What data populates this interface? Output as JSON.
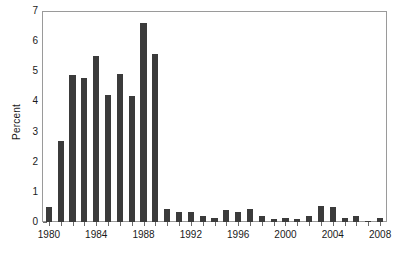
{
  "chart_data": {
    "type": "bar",
    "title": "",
    "xlabel": "",
    "ylabel": "Percent",
    "ylim": [
      0,
      7
    ],
    "xlim": [
      1979.5,
      2008.5
    ],
    "yticks": [
      0,
      1,
      2,
      3,
      4,
      5,
      6,
      7
    ],
    "ytick_labels": [
      "0",
      "1",
      "2",
      "3",
      "4",
      "5",
      "6",
      "7"
    ],
    "xtick_labels": [
      "1980",
      "1984",
      "1988",
      "1992",
      "1996",
      "2000",
      "2004",
      "2008"
    ],
    "xticks": [
      1980,
      1984,
      1988,
      1992,
      1996,
      2000,
      2004,
      2008
    ],
    "grid": false,
    "legend": null,
    "bar_color": "#3b3b3b",
    "frame_color": "#9a9a9a",
    "categories": [
      "1980",
      "1981",
      "1982",
      "1983",
      "1984",
      "1985",
      "1986",
      "1987",
      "1988",
      "1989",
      "1990",
      "1991",
      "1992",
      "1993",
      "1994",
      "1995",
      "1996",
      "1997",
      "1998",
      "1999",
      "2000",
      "2001",
      "2002",
      "2003",
      "2004",
      "2005",
      "2006",
      "2007",
      "2008"
    ],
    "values": [
      0.5,
      2.7,
      4.9,
      4.8,
      5.55,
      4.25,
      4.95,
      4.2,
      6.65,
      5.6,
      0.45,
      0.35,
      0.35,
      0.2,
      0.15,
      0.4,
      0.35,
      0.45,
      0.2,
      0.1,
      0.15,
      0.1,
      0.2,
      0.55,
      0.5,
      0.15,
      0.2,
      0.05,
      0.15
    ]
  }
}
